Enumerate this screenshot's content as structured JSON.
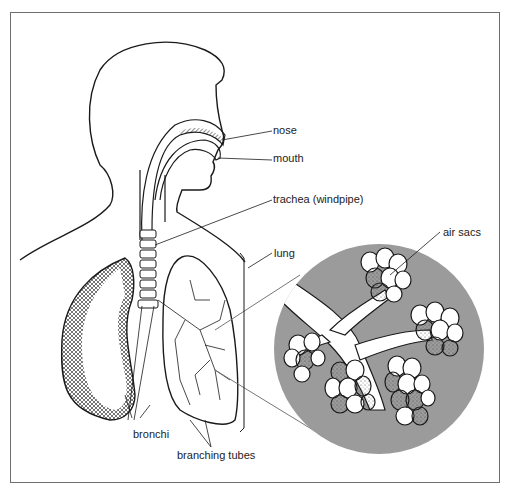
{
  "figure": {
    "labels": {
      "nose": "nose",
      "mouth": "mouth",
      "trachea": "trachea (windpipe)",
      "lung": "lung",
      "air_sacs": "air sacs",
      "bronchi": "bronchi",
      "branching_tubes": "branching tubes"
    },
    "colors": {
      "line": "#1a1a1a",
      "frame": "#6f6f6f",
      "magnifier_fill": "#9b9b9b",
      "leader_line": "#777777"
    }
  }
}
